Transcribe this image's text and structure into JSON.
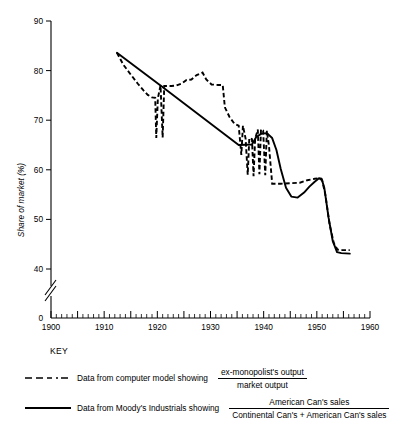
{
  "figure": {
    "y_axis_title": "Share of market (%)",
    "key_title": "KEY"
  },
  "legend": {
    "entries": [
      {
        "style": "dashed",
        "sample_name": "dashed-line-sample",
        "text": "Data from computer model showing",
        "fraction_numerator": "ex-monopolist's output",
        "fraction_denominator": "market output"
      },
      {
        "style": "solid",
        "sample_name": "solid-line-sample",
        "text": "Data from Moody's Industrials showing",
        "fraction_numerator": "American Can's sales",
        "fraction_denominator": "Continental Can's + American Can's sales"
      }
    ]
  },
  "chart_data": {
    "type": "line",
    "title": "",
    "xlabel": "",
    "ylabel": "Share of market (%)",
    "xlim": [
      1900,
      1960
    ],
    "ylim": [
      40,
      90
    ],
    "y_axis_break": true,
    "y_zero_shown": true,
    "grid": false,
    "legend_position": "below-plot",
    "x_ticks_major": [
      1900,
      1910,
      1920,
      1930,
      1940,
      1950,
      1960
    ],
    "x_ticks_major_labels": [
      "1900",
      "1910",
      "1920",
      "1930",
      "1940",
      "1950",
      "1960"
    ],
    "x_tick_minor_interval": 1,
    "y_ticks": [
      40,
      50,
      60,
      70,
      80,
      90
    ],
    "y_tick_labels": [
      "40",
      "50",
      "60",
      "70",
      "80",
      "90"
    ],
    "series": [
      {
        "name": "Data from computer model showing ex-monopolist's output / market output",
        "style": "dashed",
        "color": "#000000",
        "points": [
          [
            1912.4,
            83.6
          ],
          [
            1913.6,
            81.2
          ],
          [
            1915.0,
            79.2
          ],
          [
            1916.3,
            77.4
          ],
          [
            1917.4,
            76.0
          ],
          [
            1918.2,
            75.1
          ],
          [
            1919.0,
            74.6
          ],
          [
            1919.6,
            74.5
          ],
          [
            1919.8,
            66.4
          ],
          [
            1920.1,
            74.4
          ],
          [
            1920.6,
            77.0
          ],
          [
            1921.0,
            66.5
          ],
          [
            1921.3,
            76.9
          ],
          [
            1922.6,
            76.9
          ],
          [
            1923.6,
            77.0
          ],
          [
            1924.6,
            77.4
          ],
          [
            1925.5,
            78.1
          ],
          [
            1926.4,
            78.2
          ],
          [
            1927.4,
            79.1
          ],
          [
            1928.5,
            79.6
          ],
          [
            1929.2,
            78.2
          ],
          [
            1930.2,
            77.2
          ],
          [
            1931.4,
            77.1
          ],
          [
            1932.3,
            77.1
          ],
          [
            1932.7,
            72.6
          ],
          [
            1933.6,
            70.6
          ],
          [
            1934.5,
            69.3
          ],
          [
            1935.3,
            68.9
          ],
          [
            1935.8,
            63.0
          ],
          [
            1936.1,
            68.9
          ],
          [
            1936.6,
            66.3
          ],
          [
            1937.0,
            59.0
          ],
          [
            1937.3,
            66.4
          ],
          [
            1937.8,
            66.2
          ],
          [
            1938.1,
            58.7
          ],
          [
            1938.4,
            66.3
          ],
          [
            1938.9,
            68.1
          ],
          [
            1939.2,
            59.1
          ],
          [
            1939.5,
            68.2
          ],
          [
            1939.9,
            67.9
          ],
          [
            1940.3,
            58.9
          ],
          [
            1940.6,
            67.9
          ],
          [
            1941.0,
            64.8
          ],
          [
            1941.6,
            57.2
          ],
          [
            1943.2,
            57.2
          ],
          [
            1945.2,
            57.3
          ],
          [
            1946.8,
            57.4
          ],
          [
            1948.2,
            57.9
          ],
          [
            1949.6,
            58.2
          ],
          [
            1950.4,
            58.3
          ],
          [
            1951.0,
            57.9
          ],
          [
            1951.6,
            55.0
          ],
          [
            1952.4,
            49.0
          ],
          [
            1953.2,
            45.2
          ],
          [
            1953.9,
            43.9
          ],
          [
            1954.8,
            43.8
          ],
          [
            1956.2,
            43.8
          ]
        ]
      },
      {
        "name": "Data from Moody's Industrials showing American Can's sales / (Continental Can's + American Can's sales)",
        "style": "solid",
        "color": "#000000",
        "points": [
          [
            1912.4,
            83.6
          ],
          [
            1920.6,
            77.0
          ],
          [
            1935.3,
            65.0
          ],
          [
            1937.8,
            65.1
          ],
          [
            1938.6,
            66.6
          ],
          [
            1939.6,
            67.3
          ],
          [
            1940.6,
            67.4
          ],
          [
            1941.6,
            66.4
          ],
          [
            1942.4,
            64.0
          ],
          [
            1943.2,
            60.2
          ],
          [
            1944.2,
            56.4
          ],
          [
            1945.2,
            54.6
          ],
          [
            1946.4,
            54.4
          ],
          [
            1947.6,
            55.4
          ],
          [
            1948.6,
            56.6
          ],
          [
            1949.6,
            57.6
          ],
          [
            1950.4,
            58.3
          ],
          [
            1950.9,
            58.2
          ],
          [
            1951.4,
            56.4
          ],
          [
            1952.2,
            50.4
          ],
          [
            1953.0,
            45.6
          ],
          [
            1953.8,
            43.4
          ],
          [
            1954.6,
            43.2
          ],
          [
            1956.2,
            43.1
          ]
        ]
      }
    ]
  }
}
